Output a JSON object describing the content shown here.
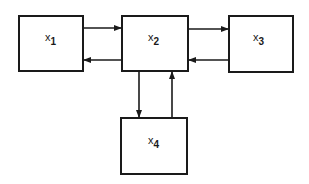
{
  "diagram": {
    "type": "block-diagram",
    "nodes": [
      {
        "id": "x1",
        "base": "x",
        "sub": "1"
      },
      {
        "id": "x2",
        "base": "x",
        "sub": "2"
      },
      {
        "id": "x3",
        "base": "x",
        "sub": "3"
      },
      {
        "id": "x4",
        "base": "x",
        "sub": "4"
      }
    ],
    "edges": [
      {
        "from": "x1",
        "to": "x2"
      },
      {
        "from": "x2",
        "to": "x1"
      },
      {
        "from": "x2",
        "to": "x3"
      },
      {
        "from": "x3",
        "to": "x2"
      },
      {
        "from": "x2",
        "to": "x4"
      },
      {
        "from": "x4",
        "to": "x2"
      }
    ],
    "colors": {
      "stroke": "#1a1a1a",
      "background": "#ffffff"
    }
  }
}
